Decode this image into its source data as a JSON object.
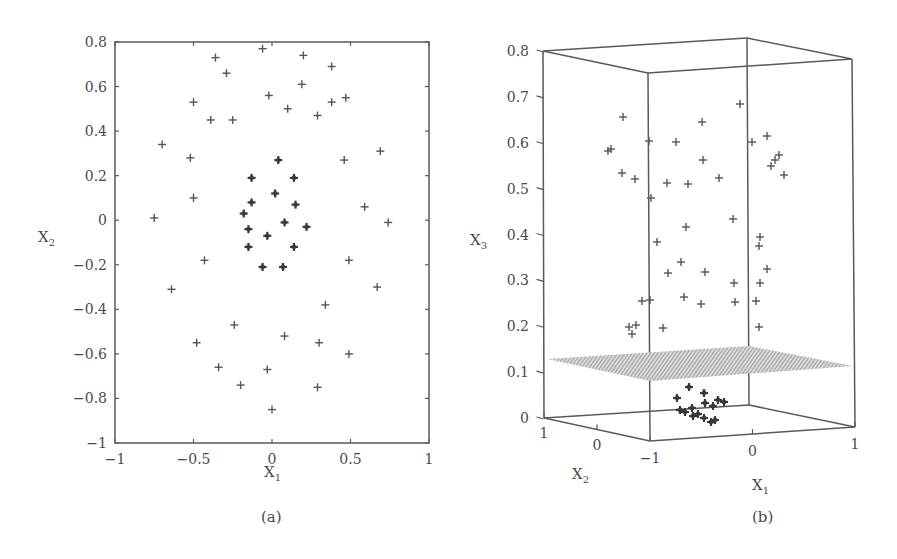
{
  "chart_data": [
    {
      "id": "a",
      "type": "scatter",
      "caption": "(a)",
      "title": "",
      "xlabel": "X",
      "xlabel_sub": "1",
      "ylabel": "X",
      "ylabel_sub": "2",
      "xlim": [
        -1,
        1
      ],
      "ylim": [
        -1,
        0.8
      ],
      "xticks": [
        "-1",
        "-0.5",
        "0",
        "0.5",
        "1"
      ],
      "yticks": [
        "0.8",
        "0.6",
        "0.4",
        "0.2",
        "0",
        "-0.2",
        "-0.4",
        "-0.6",
        "-0.8",
        "-1"
      ],
      "grid": false,
      "marker": "+",
      "series": [
        {
          "name": "outer points",
          "style": "light",
          "points": [
            [
              -0.06,
              0.77
            ],
            [
              -0.36,
              0.73
            ],
            [
              -0.29,
              0.66
            ],
            [
              0.2,
              0.74
            ],
            [
              0.38,
              0.69
            ],
            [
              -0.5,
              0.53
            ],
            [
              -0.02,
              0.56
            ],
            [
              0.1,
              0.5
            ],
            [
              -0.39,
              0.45
            ],
            [
              -0.25,
              0.45
            ],
            [
              0.29,
              0.47
            ],
            [
              0.38,
              0.53
            ],
            [
              0.47,
              0.55
            ],
            [
              0.19,
              0.61
            ],
            [
              -0.7,
              0.34
            ],
            [
              -0.52,
              0.28
            ],
            [
              0.46,
              0.27
            ],
            [
              0.69,
              0.31
            ],
            [
              -0.5,
              0.1
            ],
            [
              -0.75,
              0.01
            ],
            [
              0.59,
              0.06
            ],
            [
              0.74,
              -0.01
            ],
            [
              -0.43,
              -0.18
            ],
            [
              0.49,
              -0.18
            ],
            [
              -0.64,
              -0.31
            ],
            [
              0.67,
              -0.3
            ],
            [
              0.34,
              -0.38
            ],
            [
              -0.24,
              -0.47
            ],
            [
              -0.48,
              -0.55
            ],
            [
              0.08,
              -0.52
            ],
            [
              0.3,
              -0.55
            ],
            [
              0.49,
              -0.6
            ],
            [
              -0.34,
              -0.66
            ],
            [
              -0.03,
              -0.67
            ],
            [
              -0.2,
              -0.74
            ],
            [
              0.29,
              -0.75
            ],
            [
              0.0,
              -0.85
            ]
          ]
        },
        {
          "name": "inner cluster",
          "style": "dark",
          "points": [
            [
              0.04,
              0.27
            ],
            [
              -0.13,
              0.19
            ],
            [
              0.14,
              0.19
            ],
            [
              0.02,
              0.12
            ],
            [
              -0.13,
              0.08
            ],
            [
              0.15,
              0.07
            ],
            [
              -0.18,
              0.03
            ],
            [
              0.08,
              -0.01
            ],
            [
              0.22,
              -0.03
            ],
            [
              -0.15,
              -0.04
            ],
            [
              -0.03,
              -0.07
            ],
            [
              -0.15,
              -0.12
            ],
            [
              0.14,
              -0.12
            ],
            [
              -0.06,
              -0.21
            ],
            [
              0.07,
              -0.21
            ]
          ]
        }
      ]
    },
    {
      "id": "b",
      "type": "scatter3d",
      "caption": "(b)",
      "title": "",
      "xlabel": "X",
      "xlabel_sub": "1",
      "ylabel": "X",
      "ylabel_sub": "2",
      "zlabel": "X",
      "zlabel_sub": "3",
      "xlim": [
        -1,
        1
      ],
      "ylim": [
        -1,
        1
      ],
      "zlim": [
        0,
        0.8
      ],
      "xticks": [
        "-1",
        "0",
        "1"
      ],
      "yticks": [
        "1",
        "0"
      ],
      "zticks": [
        "0.8",
        "0.7",
        "0.6",
        "0.5",
        "0.4",
        "0.3",
        "0.2",
        "0.1",
        "0"
      ],
      "grid": false,
      "marker": "+",
      "annotations": [
        "separating hyperplane at X3 ≈ 0.11 (hatched)"
      ],
      "plane_z": 0.11,
      "series": [
        {
          "name": "outer points (lifted)",
          "style": "light",
          "screen_points": [
            [
              623,
              117
            ],
            [
              611,
              149
            ],
            [
              608,
              151
            ],
            [
              622,
              173
            ],
            [
              635,
              179
            ],
            [
              649,
              141
            ],
            [
              651,
              198
            ],
            [
              676,
              142
            ],
            [
              667,
              183
            ],
            [
              688,
              184
            ],
            [
              702,
              122
            ],
            [
              703,
              160
            ],
            [
              719,
              178
            ],
            [
              740,
              104
            ],
            [
              752,
              142
            ],
            [
              767,
              136
            ],
            [
              779,
              155
            ],
            [
              775,
              160
            ],
            [
              771,
              166
            ],
            [
              784,
              175
            ],
            [
              686,
              227
            ],
            [
              733,
              219
            ],
            [
              657,
              242
            ],
            [
              681,
              262
            ],
            [
              632,
              334
            ],
            [
              629,
              327
            ],
            [
              636,
              325
            ],
            [
              668,
              273
            ],
            [
              705,
              272
            ],
            [
              734,
              283
            ],
            [
              760,
              237
            ],
            [
              759,
              246
            ],
            [
              767,
              269
            ],
            [
              642,
              301
            ],
            [
              650,
              300
            ],
            [
              684,
              297
            ],
            [
              701,
              304
            ],
            [
              735,
              302
            ],
            [
              756,
              301
            ],
            [
              663,
              328
            ],
            [
              759,
              327
            ],
            [
              760,
              283
            ]
          ]
        },
        {
          "name": "inner cluster (near 0)",
          "style": "dark",
          "screen_points": [
            [
              689,
              387
            ],
            [
              677,
              398
            ],
            [
              704,
              393
            ],
            [
              705,
              403
            ],
            [
              718,
              400
            ],
            [
              724,
              402
            ],
            [
              713,
              406
            ],
            [
              685,
              412
            ],
            [
              692,
              408
            ],
            [
              680,
              410
            ],
            [
              698,
              414
            ],
            [
              704,
              418
            ],
            [
              711,
              422
            ],
            [
              715,
              420
            ],
            [
              693,
              416
            ]
          ]
        }
      ]
    }
  ]
}
